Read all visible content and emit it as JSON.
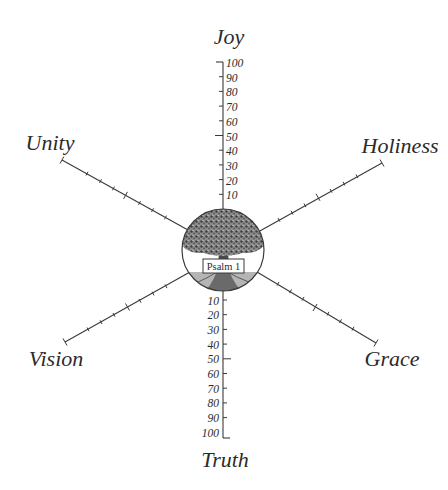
{
  "diagram": {
    "center_label": "Psalm 1",
    "center_image": "tree-icon",
    "axes": [
      {
        "label": "Joy",
        "direction": "up"
      },
      {
        "label": "Holiness",
        "direction": "upper-right"
      },
      {
        "label": "Grace",
        "direction": "lower-right"
      },
      {
        "label": "Truth",
        "direction": "down"
      },
      {
        "label": "Vision",
        "direction": "lower-left"
      },
      {
        "label": "Unity",
        "direction": "upper-left"
      }
    ],
    "scale": {
      "min": 10,
      "max": 100,
      "step": 10,
      "ticks_up": [
        "10",
        "20",
        "30",
        "40",
        "50",
        "60",
        "70",
        "80",
        "90",
        "100"
      ],
      "ticks_down": [
        "10",
        "20",
        "30",
        "40",
        "50",
        "60",
        "70",
        "80",
        "90",
        "100"
      ]
    },
    "colors": {
      "line": "#3a3a3a",
      "text": "#2b2b2b",
      "background": "#ffffff",
      "tree_dark": "#4a4a4a",
      "tree_light": "#9a9a9a"
    }
  }
}
